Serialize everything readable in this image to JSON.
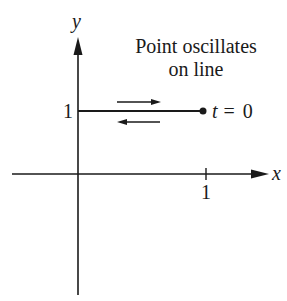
{
  "diagram": {
    "title_line1": "Point oscillates",
    "title_line2": "on line",
    "axes": {
      "x_label": "x",
      "y_label": "y",
      "x_tick_label": "1",
      "y_tick_label": "1"
    },
    "point_label": "t = 0",
    "colors": {
      "ink": "#1a1a1a",
      "background": "#ffffff"
    }
  }
}
